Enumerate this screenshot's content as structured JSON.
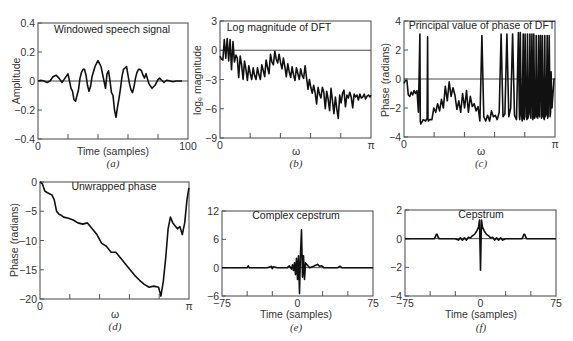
{
  "figure": {
    "panels": [
      {
        "id": "a",
        "title": "Windowed speech signal",
        "xlabel": "Time (samples)",
        "ylabel": "Amplitude",
        "letter": "(a)"
      },
      {
        "id": "b",
        "title": "Log magnitude of DFT",
        "xlabel": "ω",
        "ylabel": "logₑ magnitude",
        "letter": "(b)"
      },
      {
        "id": "c",
        "title": "Principal value of phase of DFT",
        "xlabel": "ω",
        "ylabel": "Phase (radians)",
        "letter": "(c)"
      },
      {
        "id": "d",
        "title": "Unwrapped phase",
        "xlabel": "ω",
        "ylabel": "Phase (radians)",
        "letter": "(d)"
      },
      {
        "id": "e",
        "title": "Complex cepstrum",
        "xlabel": "Time (samples)",
        "ylabel": "",
        "letter": "(e)"
      },
      {
        "id": "f",
        "title": "Cepstrum",
        "xlabel": "Time (samples)",
        "ylabel": "",
        "letter": "(f)"
      }
    ]
  },
  "chart_data": [
    {
      "type": "line",
      "panel": "a",
      "title": "Windowed speech signal",
      "xlabel": "Time (samples)",
      "ylabel": "Amplitude",
      "xlim": [
        0,
        100
      ],
      "ylim": [
        -0.4,
        0.4
      ],
      "xticks": [
        "0",
        "100"
      ],
      "yticks": [
        "0.4",
        "0.2",
        "0",
        "-0.2",
        "-0.4"
      ],
      "minor_xticks": [
        20,
        40,
        60,
        80
      ],
      "zero_line": true,
      "x": [
        0,
        2,
        4,
        6,
        8,
        10,
        12,
        14,
        16,
        18,
        20,
        21,
        22,
        23,
        24,
        25,
        26,
        27,
        28,
        29,
        30,
        31,
        32,
        33,
        34,
        35,
        36,
        38,
        40,
        42,
        44,
        45,
        46,
        47,
        48,
        49,
        50,
        51,
        52,
        53,
        54,
        55,
        56,
        57,
        58,
        59,
        60,
        61,
        62,
        63,
        64,
        65,
        66,
        67,
        68,
        69,
        70,
        71,
        72,
        74,
        76,
        78,
        80,
        81,
        82,
        83,
        84,
        85,
        86,
        88,
        90,
        92,
        94,
        96,
        98,
        100
      ],
      "y": [
        0,
        0.005,
        0,
        -0.01,
        0,
        0.03,
        0.04,
        0.02,
        -0.01,
        0.02,
        0.05,
        0.0,
        -0.05,
        -0.07,
        -0.13,
        -0.14,
        -0.1,
        -0.06,
        0.02,
        0.06,
        0.08,
        0.08,
        0.04,
        -0.03,
        -0.07,
        -0.04,
        0.03,
        0.1,
        0.14,
        0.1,
        0.0,
        -0.05,
        0.05,
        0.07,
        0.0,
        -0.08,
        -0.1,
        -0.2,
        -0.25,
        -0.18,
        -0.12,
        -0.05,
        0.03,
        0.08,
        0.09,
        0.1,
        0.04,
        -0.02,
        -0.06,
        -0.08,
        -0.04,
        0.02,
        0.06,
        0.08,
        0.08,
        0.07,
        0.04,
        0.02,
        0.05,
        -0.02,
        -0.05,
        -0.03,
        0.01,
        0.02,
        0.01,
        0.0,
        -0.01,
        0,
        0.005,
        0,
        -0.005,
        0,
        0,
        0
      ]
    },
    {
      "type": "line",
      "panel": "b",
      "title": "Log magnitude of DFT",
      "xlabel": "ω",
      "ylabel": "logₑ magnitude",
      "xlim": [
        0,
        3.1416
      ],
      "ylim": [
        -9,
        3
      ],
      "xticks": [
        "0",
        "π"
      ],
      "yticks": [
        "3",
        "0",
        "-3",
        "-6",
        "-9"
      ],
      "minor_xticks": [
        0.628,
        1.257,
        1.885,
        2.513
      ],
      "zero_line": true,
      "x": [
        0,
        0.03,
        0.06,
        0.09,
        0.12,
        0.15,
        0.18,
        0.21,
        0.24,
        0.27,
        0.3,
        0.33,
        0.36,
        0.39,
        0.42,
        0.45,
        0.48,
        0.51,
        0.54,
        0.57,
        0.6,
        0.63,
        0.66,
        0.69,
        0.72,
        0.75,
        0.78,
        0.81,
        0.84,
        0.87,
        0.9,
        0.93,
        0.96,
        0.99,
        1.02,
        1.05,
        1.08,
        1.11,
        1.14,
        1.17,
        1.2,
        1.23,
        1.26,
        1.29,
        1.32,
        1.35,
        1.38,
        1.41,
        1.44,
        1.47,
        1.5,
        1.53,
        1.56,
        1.59,
        1.62,
        1.65,
        1.68,
        1.71,
        1.74,
        1.77,
        1.8,
        1.83,
        1.86,
        1.89,
        1.92,
        1.95,
        1.98,
        2.01,
        2.04,
        2.07,
        2.1,
        2.13,
        2.16,
        2.19,
        2.22,
        2.25,
        2.28,
        2.31,
        2.34,
        2.37,
        2.4,
        2.43,
        2.46,
        2.49,
        2.52,
        2.55,
        2.58,
        2.61,
        2.64,
        2.67,
        2.7,
        2.73,
        2.76,
        2.79,
        2.82,
        2.85,
        2.88,
        2.91,
        2.94,
        2.97,
        3.0,
        3.03,
        3.06,
        3.09,
        3.12,
        3.14
      ],
      "y": [
        -0.6,
        -0.9,
        -1.0,
        1.1,
        -0.8,
        1.2,
        -1.1,
        1.1,
        -2.0,
        0.9,
        -1.2,
        -0.5,
        -0.8,
        -2.8,
        -0.6,
        -1.5,
        -3.0,
        -1.1,
        -2.0,
        -3.1,
        -1.6,
        -2.4,
        -3.0,
        -1.8,
        -2.6,
        -3.0,
        -1.8,
        -2.5,
        -3.0,
        -1.5,
        -2.1,
        -2.7,
        -1.0,
        -1.8,
        -2.4,
        -0.4,
        -1.2,
        -1.5,
        -0.1,
        -0.9,
        -1.3,
        -0.4,
        -1.3,
        -1.9,
        -0.8,
        -1.7,
        -2.7,
        -1.4,
        -2.2,
        -2.8,
        -1.7,
        -2.5,
        -3.1,
        -1.8,
        -2.4,
        -3.0,
        -1.9,
        -2.6,
        -2.9,
        -1.6,
        -2.8,
        -4.0,
        -3.0,
        -3.8,
        -4.4,
        -3.6,
        -4.4,
        -5.5,
        -3.8,
        -4.5,
        -4.9,
        -3.8,
        -4.3,
        -6.0,
        -4.2,
        -5.0,
        -6.2,
        -3.9,
        -5.2,
        -6.5,
        -4.8,
        -6.0,
        -7.0,
        -4.6,
        -5.4,
        -4.4,
        -4.1,
        -5.8,
        -4.6,
        -4.9,
        -4.3,
        -4.8,
        -5.9,
        -4.5,
        -4.8,
        -4.6,
        -5.1,
        -4.5,
        -4.9,
        -4.8,
        -4.5,
        -5.0,
        -4.7,
        -4.6,
        -4.8,
        -4.6
      ],
      "note": "approximate trace read from figure"
    },
    {
      "type": "line",
      "panel": "c",
      "title": "Principal value of phase of DFT",
      "xlabel": "ω",
      "ylabel": "Phase (radians)",
      "xlim": [
        0,
        3.1416
      ],
      "ylim": [
        -4,
        4
      ],
      "xticks": [
        "0",
        "π"
      ],
      "yticks": [
        "4",
        "2",
        "0",
        "-2",
        "-4"
      ],
      "minor_xticks": [
        0.628,
        1.257,
        1.885,
        2.513
      ],
      "zero_line": true,
      "x": [
        0,
        0.03,
        0.06,
        0.09,
        0.12,
        0.15,
        0.18,
        0.21,
        0.24,
        0.27,
        0.3,
        0.33,
        0.34,
        0.35,
        0.36,
        0.37,
        0.4,
        0.45,
        0.48,
        0.49,
        0.5,
        0.51,
        0.53,
        0.58,
        0.62,
        0.66,
        0.7,
        0.74,
        0.78,
        0.82,
        0.86,
        0.9,
        0.94,
        0.98,
        1.02,
        1.06,
        1.1,
        1.14,
        1.18,
        1.22,
        1.26,
        1.3,
        1.34,
        1.38,
        1.42,
        1.46,
        1.5,
        1.54,
        1.58,
        1.62,
        1.66,
        1.7,
        1.74,
        1.78,
        1.82,
        1.86,
        1.9,
        1.94,
        1.98,
        2.02,
        2.06,
        2.1,
        2.14,
        2.18,
        2.22,
        2.26,
        2.3,
        2.34,
        2.38,
        2.4,
        2.41,
        2.42,
        2.44,
        2.46,
        2.48,
        2.49,
        2.5,
        2.52,
        2.54,
        2.56,
        2.57,
        2.58,
        2.6,
        2.62,
        2.63,
        2.64,
        2.66,
        2.68,
        2.69,
        2.7,
        2.72,
        2.74,
        2.75,
        2.76,
        2.78,
        2.8,
        2.81,
        2.82,
        2.84,
        2.86,
        2.87,
        2.88,
        2.9,
        2.92,
        2.93,
        2.94,
        2.96,
        2.98,
        2.99,
        3.0,
        3.02,
        3.04,
        3.05,
        3.06,
        3.08,
        3.1,
        3.12,
        3.14
      ],
      "y": [
        -0.3,
        -0.1,
        -0.1,
        -1.1,
        -1.2,
        -0.9,
        -1.1,
        -0.8,
        -1.0,
        -0.8,
        -2.3,
        3.1,
        -2.9,
        -3.1,
        -3.0,
        -3.0,
        -2.8,
        -2.9,
        -2.7,
        2.9,
        -2.8,
        -2.9,
        -2.8,
        -2.8,
        -2.0,
        -2.3,
        -1.7,
        -2.2,
        -1.4,
        -2.0,
        -0.5,
        -1.5,
        -0.2,
        -1.2,
        -0.6,
        -1.1,
        -2.1,
        -1.5,
        -2.3,
        -1.0,
        -2.0,
        -0.8,
        -2.3,
        -1.2,
        -1.9,
        -1.7,
        -2.2,
        -1.9,
        -2.9,
        3.0,
        -2.6,
        -2.9,
        -2.5,
        -2.9,
        -2.2,
        -2.6,
        -2.5,
        -2.8,
        -2.3,
        3.1,
        -2.6,
        -2.4,
        3.1,
        -2.6,
        -2.0,
        3.1,
        -2.5,
        -2.8,
        3.2,
        -2.6,
        -2.8,
        3.2,
        -2.4,
        -2.9,
        3.1,
        -2.7,
        -2.8,
        3.1,
        -2.6,
        -2.8,
        3.1,
        -2.7,
        -2.2,
        3.1,
        -2.5,
        -2.7,
        3.1,
        -2.8,
        -2.6,
        3.1,
        -2.7,
        -2.3,
        3.0,
        -2.6,
        -2.7,
        3.0,
        -2.5,
        -2.6,
        3.0,
        -2.7,
        -2.5,
        3.0,
        -2.6,
        -2.8,
        3.0,
        -2.6,
        -2.4,
        3.0,
        -2.7,
        -2.5,
        3.0,
        -2.6,
        -2.3,
        0.5,
        -2.0,
        -1.0,
        0.0,
        0.0
      ],
      "note": "approximate trace with 2π wrap discontinuities"
    },
    {
      "type": "line",
      "panel": "d",
      "title": "Unwrapped phase",
      "xlabel": "ω",
      "ylabel": "Phase (radians)",
      "xlim": [
        0,
        3.1416
      ],
      "ylim": [
        -20,
        0
      ],
      "xticks": [
        "0",
        "π"
      ],
      "yticks": [
        "0",
        "-5",
        "-10",
        "-15",
        "-20"
      ],
      "minor_xticks": [
        0.628,
        1.257,
        1.885,
        2.513
      ],
      "x": [
        0,
        0.05,
        0.1,
        0.15,
        0.2,
        0.25,
        0.3,
        0.35,
        0.4,
        0.45,
        0.5,
        0.6,
        0.7,
        0.8,
        0.9,
        1.0,
        1.1,
        1.2,
        1.3,
        1.4,
        1.5,
        1.6,
        1.7,
        1.8,
        1.9,
        2.0,
        2.1,
        2.2,
        2.3,
        2.4,
        2.5,
        2.55,
        2.6,
        2.65,
        2.7,
        2.75,
        2.8,
        2.85,
        2.9,
        2.95,
        3.0,
        3.05,
        3.1,
        3.14
      ],
      "y": [
        0,
        -0.3,
        -1.5,
        -1.8,
        -2.0,
        -2.2,
        -3.0,
        -5.0,
        -5.5,
        -5.7,
        -6.0,
        -6.2,
        -6.5,
        -7.0,
        -7.2,
        -7.0,
        -8.0,
        -9.0,
        -10.5,
        -11.0,
        -12.0,
        -12.0,
        -13.0,
        -14.0,
        -15.0,
        -16.0,
        -16.8,
        -17.5,
        -18.0,
        -17.8,
        -18.0,
        -19.5,
        -17.0,
        -13.0,
        -8.0,
        -6.0,
        -7.0,
        -7.5,
        -8.0,
        -7.6,
        -9.0,
        -7.0,
        -3.0,
        -1.0
      ]
    },
    {
      "type": "line",
      "panel": "e",
      "title": "Complex cepstrum",
      "xlabel": "Time (samples)",
      "ylabel": "",
      "xlim": [
        -75,
        75
      ],
      "ylim": [
        -6,
        12
      ],
      "xticks": [
        "-75",
        "0",
        "75"
      ],
      "yticks": [
        "12",
        "6",
        "0",
        "-6"
      ],
      "minor_xticks": [
        -50,
        -25,
        25,
        50
      ],
      "x": [
        -75,
        -50,
        -49,
        -48,
        -47,
        -30,
        -26,
        -25,
        -24,
        -20,
        -10,
        -8,
        -6,
        -5,
        -4,
        -3,
        -2,
        -1,
        0,
        1,
        2,
        3,
        4,
        5,
        6,
        7,
        8,
        10,
        12,
        16,
        18,
        20,
        22,
        24,
        26,
        40,
        42,
        43,
        44,
        75
      ],
      "y": [
        0,
        0,
        0.4,
        0,
        0,
        0,
        0.3,
        -0.2,
        0.2,
        0,
        0,
        0.4,
        -0.3,
        0.6,
        -0.6,
        1.0,
        -1.5,
        2.0,
        -2.5,
        2.5,
        -5.5,
        3.0,
        8.0,
        -2.0,
        2.5,
        -2.5,
        1.0,
        0.5,
        0,
        0.3,
        0.5,
        0.7,
        0.3,
        0.4,
        0,
        0,
        0.3,
        0.2,
        0,
        0
      ]
    },
    {
      "type": "line",
      "panel": "f",
      "title": "Cepstrum",
      "xlabel": "Time (samples)",
      "ylabel": "",
      "xlim": [
        -75,
        75
      ],
      "ylim": [
        -4,
        2
      ],
      "xticks": [
        "-75",
        "0",
        "75"
      ],
      "yticks": [
        "2",
        "0",
        "-2",
        "-4"
      ],
      "minor_xticks": [
        -50,
        -25,
        25,
        50
      ],
      "x": [
        -75,
        -46,
        -45,
        -44,
        -43,
        -42,
        -41,
        -40,
        -25,
        -22,
        -20,
        -18,
        -16,
        -14,
        -12,
        -10,
        -8,
        -6,
        -4,
        -2,
        -1,
        0,
        1,
        2,
        4,
        6,
        8,
        10,
        12,
        14,
        16,
        18,
        20,
        22,
        25,
        40,
        41,
        42,
        43,
        44,
        45,
        46,
        75
      ],
      "y": [
        0,
        0,
        0.1,
        0.3,
        0.3,
        0.1,
        0,
        0,
        0,
        -0.1,
        0.05,
        -0.1,
        0.05,
        -0.1,
        0.1,
        0.05,
        0.2,
        0.3,
        0.5,
        0.8,
        1.3,
        -2.2,
        1.3,
        0.8,
        0.5,
        0.3,
        0.2,
        0.05,
        0.1,
        -0.1,
        0.05,
        -0.1,
        0.05,
        -0.1,
        0,
        0,
        0,
        0.1,
        0.3,
        0.3,
        0.1,
        0,
        0
      ]
    }
  ]
}
